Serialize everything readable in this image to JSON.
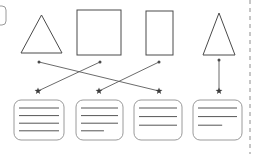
{
  "diagram": {
    "canvas": {
      "width": 257,
      "height": 154,
      "background": "#ffffff"
    },
    "colors": {
      "shape_stroke": "#4a4a4a",
      "card_stroke": "#9a9a9a",
      "card_line": "#555555",
      "connector": "#5a5a5a",
      "marker": "#3c3c3c",
      "divider": "#b8b8b8"
    },
    "shapes": [
      {
        "id": "shape-1",
        "kind": "triangle",
        "label": "triangle",
        "x": 21,
        "y": 15,
        "width": 41,
        "height": 38
      },
      {
        "id": "shape-2",
        "kind": "square",
        "label": "square",
        "x": 77,
        "y": 10,
        "width": 44,
        "height": 45
      },
      {
        "id": "shape-3",
        "kind": "rectangle",
        "label": "vertical-rectangle",
        "x": 146,
        "y": 11,
        "width": 27,
        "height": 44
      },
      {
        "id": "shape-4",
        "kind": "triangle",
        "label": "tall-triangle",
        "x": 203,
        "y": 13,
        "width": 32,
        "height": 42
      }
    ],
    "cards": [
      {
        "id": "card-1",
        "x": 14,
        "y": 100,
        "width": 50,
        "height": 40,
        "lines": [
          1,
          1,
          1,
          1
        ]
      },
      {
        "id": "card-2",
        "x": 76,
        "y": 100,
        "width": 47,
        "height": 40,
        "lines": [
          1,
          1,
          1,
          0.62
        ]
      },
      {
        "id": "card-3",
        "x": 134,
        "y": 100,
        "width": 48,
        "height": 40,
        "lines": [
          1,
          1,
          1
        ]
      },
      {
        "id": "card-4",
        "x": 193,
        "y": 100,
        "width": 49,
        "height": 40,
        "lines": [
          1,
          1,
          0.62
        ]
      }
    ],
    "connectors": [
      {
        "id": "connector-1",
        "from": "shape-1",
        "to": "card-3",
        "x1": 39,
        "y1": 62,
        "x2": 159,
        "y2": 91,
        "start_marker": "dot",
        "end_marker": "star"
      },
      {
        "id": "connector-2",
        "from": "shape-2",
        "to": "card-1",
        "x1": 100,
        "y1": 62,
        "x2": 38,
        "y2": 91,
        "start_marker": "dot",
        "end_marker": "star"
      },
      {
        "id": "connector-3",
        "from": "shape-3",
        "to": "card-2",
        "x1": 159,
        "y1": 62,
        "x2": 99,
        "y2": 91,
        "start_marker": "dot",
        "end_marker": "star"
      },
      {
        "id": "connector-4",
        "from": "shape-4",
        "to": "card-4",
        "x1": 219,
        "y1": 60,
        "x2": 219,
        "y2": 91,
        "start_marker": "dot",
        "end_marker": "star"
      }
    ],
    "divider": {
      "id": "right-divider",
      "orientation": "vertical",
      "x": 250,
      "y1": 0,
      "y2": 154,
      "style": "dashed"
    },
    "partial_card": {
      "id": "partial-card-left",
      "x": -10,
      "y": 6,
      "width": 16,
      "height": 19,
      "radius": 4
    }
  }
}
